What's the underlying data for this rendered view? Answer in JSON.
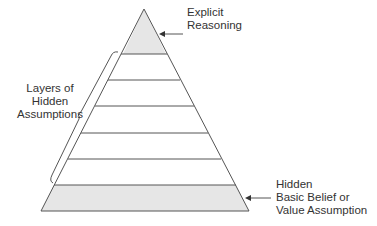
{
  "diagram": {
    "type": "pyramid",
    "labels": {
      "top": [
        "Explicit",
        "Reasoning"
      ],
      "middle": [
        "Layers of",
        "Hidden",
        "Assumptions"
      ],
      "bottom": [
        "Hidden",
        "Basic Belief or",
        "Value Assumption"
      ]
    },
    "layers": [
      {
        "name": "Explicit Reasoning",
        "shaded": true
      },
      {
        "name": "Hidden Assumption Layer 1",
        "shaded": false
      },
      {
        "name": "Hidden Assumption Layer 2",
        "shaded": false
      },
      {
        "name": "Hidden Assumption Layer 3",
        "shaded": false
      },
      {
        "name": "Hidden Assumption Layer 4",
        "shaded": false
      },
      {
        "name": "Hidden Assumption Layer 5",
        "shaded": false
      },
      {
        "name": "Hidden Basic Belief or Value Assumption",
        "shaded": true
      }
    ],
    "colors": {
      "shade": "#e6e6e6",
      "line": "#555555",
      "text": "#333333",
      "background": "#ffffff"
    }
  }
}
